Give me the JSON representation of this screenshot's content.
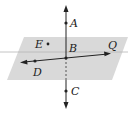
{
  "diagram": {
    "type": "geometry-plane-lines",
    "plane": {
      "fill": "#d9d9d9"
    },
    "points": {
      "A": {
        "label": "A",
        "x": 66,
        "y": 23
      },
      "B": {
        "label": "B",
        "x": 66,
        "y": 58
      },
      "C": {
        "label": "C",
        "x": 66,
        "y": 91
      },
      "D": {
        "label": "D",
        "x": 35,
        "y": 61
      },
      "E": {
        "label": "E",
        "x": 48,
        "y": 44
      },
      "Q": {
        "label": "Q",
        "x": 110,
        "y": 54
      }
    },
    "line_color": "#222222"
  }
}
